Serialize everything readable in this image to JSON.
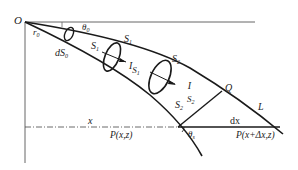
{
  "diagram": {
    "labels": {
      "origin": "O",
      "r0": "r",
      "r0_sub": "0",
      "theta0": "θ",
      "theta0_sub": "0",
      "dS0": "dS",
      "dS0_sub": "0",
      "S1_top": "S",
      "S1_top_sub": "1",
      "S1_left": "S",
      "S1_left_sub": "1",
      "I_S1": "I",
      "I_S1_sub": "S",
      "I_S1_subsub": "1",
      "S2_top": "S",
      "S2_top_sub": "2",
      "I_S2": "I",
      "I_S2_sub": "S",
      "I_S2_subsub": "2",
      "S2_bottom": "S",
      "S2_bottom_sub": "2",
      "Q": "Q",
      "L": "L",
      "x": "x",
      "dx": "dx",
      "P1": "P(x,z)",
      "P2": "P(x+Δx,z)",
      "thetaS": "θ",
      "thetaS_sub": "s"
    },
    "colors": {
      "line": "#1a1a1a",
      "axis": "#555555"
    }
  }
}
